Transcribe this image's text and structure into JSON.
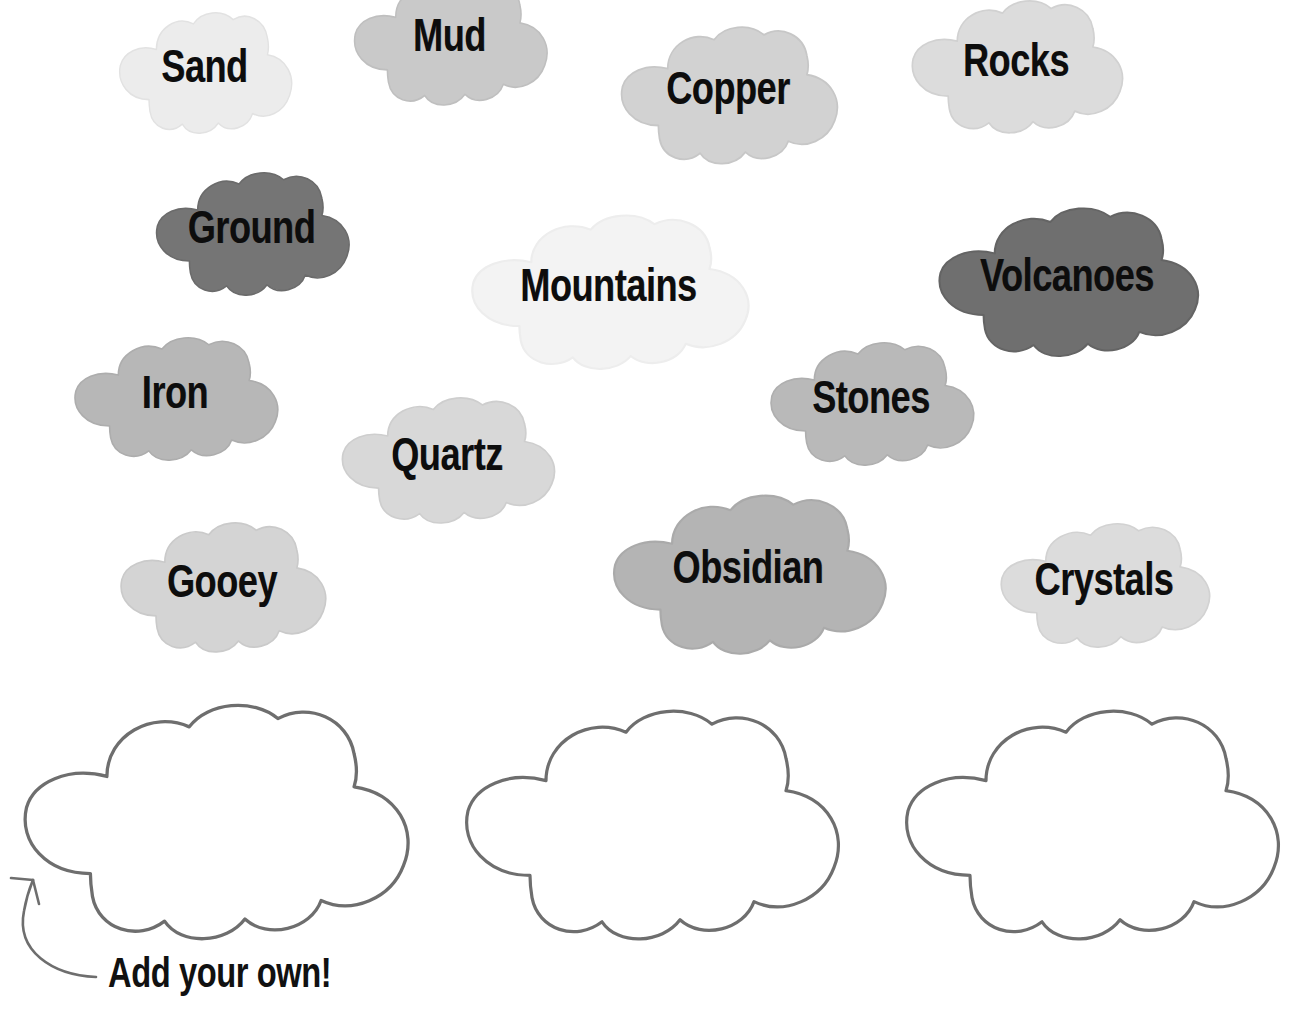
{
  "page": {
    "kind": "word-bank-worksheet",
    "background_color": "#ffffff",
    "theme": "cloud word bubbles",
    "text_color": "#0d0d0d",
    "outline_color": "#6e6e6e"
  },
  "word_clouds": [
    {
      "id": "sand",
      "label": "Sand",
      "fill": "#ececec",
      "stroke": "#e2e2e2",
      "x": 112,
      "y": 10,
      "w": 185,
      "h": 128,
      "font_size": 41
    },
    {
      "id": "mud",
      "label": "Mud",
      "fill": "#c9c9c9",
      "stroke": "#bfbfbf",
      "x": 346,
      "y": -24,
      "w": 207,
      "h": 134,
      "font_size": 41
    },
    {
      "id": "copper",
      "label": "Copper",
      "fill": "#d2d2d2",
      "stroke": "#c7c7c7",
      "x": 612,
      "y": 24,
      "w": 232,
      "h": 145,
      "font_size": 41
    },
    {
      "id": "rocks",
      "label": "Rocks",
      "fill": "#dcdcdc",
      "stroke": "#d1d1d1",
      "x": 903,
      "y": -2,
      "w": 226,
      "h": 140,
      "font_size": 41
    },
    {
      "id": "ground",
      "label": "Ground",
      "fill": "#757575",
      "stroke": "#6b6b6b",
      "x": 148,
      "y": 170,
      "w": 207,
      "h": 130,
      "font_size": 41
    },
    {
      "id": "mountains",
      "label": "Mountains",
      "fill": "#f3f3f3",
      "stroke": "#ededed",
      "x": 460,
      "y": 212,
      "w": 297,
      "h": 163,
      "font_size": 41
    },
    {
      "id": "volcanoes",
      "label": "Volcanoes",
      "fill": "#6f6f6f",
      "stroke": "#646464",
      "x": 928,
      "y": 205,
      "w": 278,
      "h": 157,
      "font_size": 41
    },
    {
      "id": "iron",
      "label": "Iron",
      "fill": "#b7b7b7",
      "stroke": "#adadad",
      "x": 66,
      "y": 335,
      "w": 218,
      "h": 130,
      "font_size": 41
    },
    {
      "id": "stones",
      "label": "Stones",
      "fill": "#b9b9b9",
      "stroke": "#afafaf",
      "x": 762,
      "y": 340,
      "w": 218,
      "h": 130,
      "font_size": 41
    },
    {
      "id": "quartz",
      "label": "Quartz",
      "fill": "#d8d8d8",
      "stroke": "#cecece",
      "x": 333,
      "y": 395,
      "w": 228,
      "h": 133,
      "font_size": 41
    },
    {
      "id": "gooey",
      "label": "Gooey",
      "fill": "#d4d4d4",
      "stroke": "#cacaca",
      "x": 112,
      "y": 520,
      "w": 220,
      "h": 137,
      "font_size": 41
    },
    {
      "id": "obsidian",
      "label": "Obsidian",
      "fill": "#b4b4b4",
      "stroke": "#aaaaaa",
      "x": 602,
      "y": 492,
      "w": 292,
      "h": 168,
      "font_size": 41
    },
    {
      "id": "crystals",
      "label": "Crystals",
      "fill": "#dcdcdc",
      "stroke": "#d2d2d2",
      "x": 992,
      "y": 521,
      "w": 224,
      "h": 131,
      "font_size": 41
    }
  ],
  "blank_clouds": [
    {
      "id": "blank-1",
      "x": 8,
      "y": 700,
      "w": 412,
      "h": 248,
      "fill": "#ffffff",
      "stroke": "#6e6e6e"
    },
    {
      "id": "blank-2",
      "x": 450,
      "y": 706,
      "w": 400,
      "h": 242,
      "fill": "#ffffff",
      "stroke": "#6e6e6e"
    },
    {
      "id": "blank-3",
      "x": 890,
      "y": 706,
      "w": 400,
      "h": 242,
      "fill": "#ffffff",
      "stroke": "#6e6e6e"
    }
  ],
  "annotation": {
    "text": "Add your own!",
    "text_x": 108,
    "text_y": 952,
    "arrow_color": "#6e6e6e",
    "arrow_points_to": "blank-1"
  }
}
